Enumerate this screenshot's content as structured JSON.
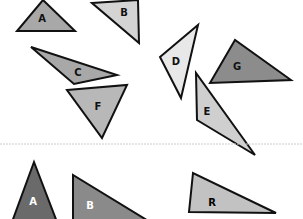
{
  "top_set": {
    "triangles": [
      {
        "label": "A",
        "fill": "#a8a8a8",
        "points": "43,0 17,31 75,31",
        "lx": 42,
        "ly": 22
      },
      {
        "label": "B",
        "fill": "#d4d4d4",
        "points": "92,3 138,0 139,43",
        "lx": 124,
        "ly": 16
      },
      {
        "label": "C",
        "fill": "#a8a8a8",
        "points": "31,47 117,75 74,84",
        "lx": 78,
        "ly": 76
      },
      {
        "label": "F",
        "fill": "#b8b8b8",
        "points": "67,90 127,85 102,138",
        "lx": 98,
        "ly": 110
      },
      {
        "label": "D",
        "fill": "#e8e8e8",
        "points": "160,57 198,25 181,98",
        "lx": 176,
        "ly": 65
      },
      {
        "label": "G",
        "fill": "#8c8c8c",
        "points": "210,83 235,40 291,80",
        "lx": 237,
        "ly": 70
      },
      {
        "label": "E",
        "fill": "#cfcfcf",
        "points": "196,73 197,120 255,155",
        "lx": 207,
        "ly": 115
      }
    ]
  },
  "divider": {
    "y": 144,
    "color": "#cccccc"
  },
  "bottom_set": {
    "triangles": [
      {
        "label": "A",
        "fill": "#6a6a6a",
        "text_color": "#ffffff",
        "points": "34,162 12,222 57,222",
        "lx": 33,
        "ly": 205
      },
      {
        "label": "B",
        "fill": "#8a8a8a",
        "text_color": "#ffffff",
        "points": "73,175 73,222 150,222",
        "lx": 90,
        "ly": 209
      },
      {
        "label": "R",
        "fill": "#c2c2c2",
        "text_color": "#000000",
        "points": "193,173 189,212 276,213",
        "lx": 212,
        "ly": 206
      }
    ]
  }
}
